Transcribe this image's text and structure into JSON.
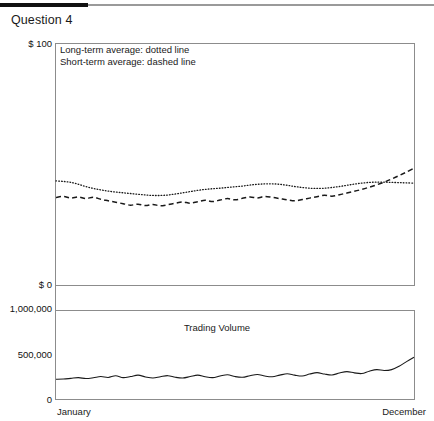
{
  "header": {
    "title": "Question 4"
  },
  "price_chart": {
    "legend": {
      "line1": "Long-term average: dotted line",
      "line2": "Short-term average: dashed line"
    },
    "y_top_label": "$ 100",
    "y_bottom_label": "$ 0"
  },
  "volume_chart": {
    "title": "Trading Volume",
    "y_top_label": "1,000,000",
    "y_mid_label": "500,000",
    "y_bottom_label": "0"
  },
  "x_axis": {
    "start": "January",
    "end": "December"
  },
  "colors": {
    "ink": "#1a1a1a",
    "rule_black": "#111111",
    "rule_gray": "#9a9a9a",
    "frame": "#8c8c8c"
  },
  "chart_data": [
    {
      "type": "line",
      "title": "Stock price averages",
      "xlabel": "",
      "ylabel": "$",
      "ylim": [
        0,
        100
      ],
      "xlim": [
        0,
        12
      ],
      "grid": false,
      "legend_position": "inside-top-left",
      "x": [
        0,
        0.25,
        0.5,
        0.75,
        1,
        1.25,
        1.5,
        1.75,
        2,
        2.25,
        2.5,
        2.75,
        3,
        3.25,
        3.5,
        3.75,
        4,
        4.25,
        4.5,
        4.75,
        5,
        5.25,
        5.5,
        5.75,
        6,
        6.25,
        6.5,
        6.75,
        7,
        7.25,
        7.5,
        7.75,
        8,
        8.25,
        8.5,
        8.75,
        9,
        9.25,
        9.5,
        9.75,
        10,
        10.25,
        10.5,
        10.75,
        11,
        11.25,
        11.5,
        11.75,
        12
      ],
      "series": [
        {
          "name": "Long-term average: dotted line",
          "style": "dotted",
          "values": [
            43.0,
            42.8,
            42.4,
            41.6,
            40.7,
            39.9,
            39.3,
            38.8,
            38.4,
            38.1,
            37.8,
            37.5,
            37.2,
            37.0,
            37.0,
            37.2,
            37.6,
            38.1,
            38.6,
            39.1,
            39.5,
            39.8,
            40.0,
            40.3,
            40.6,
            40.9,
            41.3,
            41.6,
            41.8,
            41.8,
            41.6,
            41.2,
            40.7,
            40.3,
            40.0,
            39.9,
            40.0,
            40.3,
            40.7,
            41.2,
            41.7,
            42.1,
            42.4,
            42.5,
            42.5,
            42.4,
            42.3,
            42.2,
            42.1
          ]
        },
        {
          "name": "Short-term average: dashed line",
          "style": "dashed",
          "values": [
            36.2,
            36.6,
            35.9,
            36.4,
            35.7,
            36.3,
            35.4,
            34.8,
            34.2,
            33.6,
            33.0,
            33.4,
            32.8,
            33.3,
            32.7,
            33.2,
            33.8,
            34.3,
            33.8,
            34.4,
            35.0,
            34.5,
            35.1,
            35.7,
            35.2,
            35.8,
            36.4,
            36.0,
            36.6,
            36.2,
            35.7,
            35.2,
            34.8,
            35.3,
            35.9,
            36.5,
            37.1,
            36.7,
            37.3,
            38.0,
            38.7,
            39.5,
            40.4,
            41.4,
            42.5,
            43.8,
            45.2,
            46.7,
            48.3
          ]
        }
      ]
    },
    {
      "type": "line",
      "title": "Trading Volume",
      "xlabel": "",
      "ylabel": "",
      "ylim": [
        0,
        1000000
      ],
      "xlim": [
        0,
        12
      ],
      "grid": false,
      "x": [
        0,
        0.25,
        0.5,
        0.75,
        1,
        1.25,
        1.5,
        1.75,
        2,
        2.25,
        2.5,
        2.75,
        3,
        3.25,
        3.5,
        3.75,
        4,
        4.25,
        4.5,
        4.75,
        5,
        5.25,
        5.5,
        5.75,
        6,
        6.25,
        6.5,
        6.75,
        7,
        7.25,
        7.5,
        7.75,
        8,
        8.25,
        8.5,
        8.75,
        9,
        9.25,
        9.5,
        9.75,
        10,
        10.25,
        10.5,
        10.75,
        11,
        11.25,
        11.5,
        11.75,
        12
      ],
      "series": [
        {
          "name": "Trading Volume",
          "style": "solid",
          "values": [
            222000,
            224000,
            232000,
            240000,
            230000,
            238000,
            252000,
            242000,
            262000,
            240000,
            252000,
            268000,
            248000,
            236000,
            250000,
            262000,
            244000,
            236000,
            252000,
            268000,
            250000,
            240000,
            258000,
            272000,
            252000,
            244000,
            262000,
            276000,
            258000,
            250000,
            268000,
            284000,
            268000,
            258000,
            280000,
            296000,
            280000,
            270000,
            292000,
            308000,
            294000,
            286000,
            312000,
            330000,
            320000,
            330000,
            368000,
            420000,
            470000
          ]
        }
      ]
    }
  ]
}
